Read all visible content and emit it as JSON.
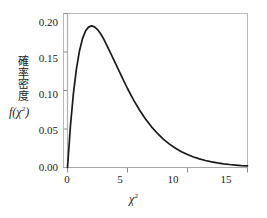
{
  "chart_data": {
    "type": "line",
    "title": "",
    "xlabel": "χ²",
    "ylabel_jp": "確率密度",
    "ylabel_math": "f(χ²)",
    "xlim": [
      0,
      15
    ],
    "ylim": [
      0,
      0.2
    ],
    "xticks": [
      0,
      5,
      10,
      15
    ],
    "xtick_labels": [
      "0",
      "5",
      "10",
      "15"
    ],
    "yticks": [
      0.0,
      0.05,
      0.1,
      0.15,
      0.2
    ],
    "ytick_labels": [
      "0.00",
      "0.05",
      "0.10",
      "0.15",
      "0.20"
    ],
    "grid": false,
    "legend": "none",
    "distribution": "chi-square probability density, 4 degrees of freedom",
    "peak_x": 2.0,
    "peak_y": 0.1839,
    "series": [
      {
        "name": "f(χ²)",
        "color": "#1a1a1a",
        "x": [
          0.0,
          0.25,
          0.5,
          0.75,
          1.0,
          1.25,
          1.5,
          1.75,
          2.0,
          2.25,
          2.5,
          2.75,
          3.0,
          3.5,
          4.0,
          4.5,
          5.0,
          5.5,
          6.0,
          6.5,
          7.0,
          7.5,
          8.0,
          8.5,
          9.0,
          9.5,
          10.0,
          10.5,
          11.0,
          11.5,
          12.0,
          12.5,
          13.0,
          13.5,
          14.0,
          14.5,
          15.0
        ],
        "y": [
          0.0,
          0.0551,
          0.0973,
          0.1288,
          0.1516,
          0.1674,
          0.1772,
          0.1823,
          0.1839,
          0.1826,
          0.1791,
          0.174,
          0.1673,
          0.1516,
          0.1353,
          0.1186,
          0.1026,
          0.0879,
          0.0747,
          0.063,
          0.0528,
          0.0442,
          0.0366,
          0.0303,
          0.025,
          0.0206,
          0.0168,
          0.0137,
          0.0112,
          0.0091,
          0.0074,
          0.006,
          0.0048,
          0.0039,
          0.0032,
          0.0025,
          0.0021
        ]
      }
    ]
  },
  "axes": {
    "frame_color": "#b8b8b8",
    "zero_line_color": "#a8a8a8",
    "tick_color": "#8a8a8a",
    "text_color": "#1a1a1a"
  }
}
